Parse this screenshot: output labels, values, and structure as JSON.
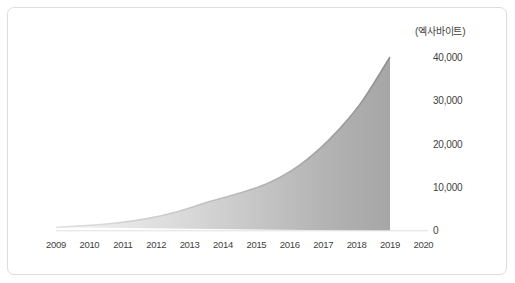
{
  "chart_data": {
    "type": "area",
    "title": "",
    "subtitle": "",
    "xlabel": "",
    "ylabel": "",
    "unit_label": "(엑사바이트)",
    "categories": [
      "2009",
      "2010",
      "2011",
      "2012",
      "2013",
      "2014",
      "2015",
      "2016",
      "2017",
      "2018",
      "2019",
      "2020"
    ],
    "values": [
      800,
      1200,
      1800,
      2800,
      4400,
      6600,
      8600,
      11000,
      15000,
      21000,
      29000,
      40000
    ],
    "series": [
      {
        "name": "데이터 생성량",
        "values": [
          800,
          1200,
          1800,
          2800,
          4400,
          6600,
          8600,
          11000,
          15000,
          21000,
          29000,
          40000
        ]
      }
    ],
    "y_ticks": [
      "0",
      "10,000",
      "20,000",
      "30,000",
      "40,000"
    ],
    "y_tick_values": [
      0,
      10000,
      20000,
      30000,
      40000
    ],
    "ylim": [
      0,
      40000
    ],
    "grid": false,
    "legend": false,
    "legend_position": "none",
    "colors": {
      "fill_left": "#eeeeee",
      "fill_right": "#a8a8a8",
      "line": "#9a9a9a",
      "axis_text": "#3f3f3f",
      "card_border": "#dddddd",
      "background": "#ffffff"
    }
  }
}
